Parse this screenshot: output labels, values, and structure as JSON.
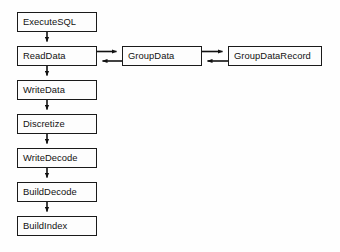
{
  "diagram": {
    "type": "flowchart",
    "background_color": "#fefefe",
    "box_border_color": "#1a1a1a",
    "box_fill_color": "#fdfdfd",
    "arrow_color": "#111111",
    "nodes": [
      {
        "id": "executesql",
        "label": "ExecuteSQL",
        "x": 17,
        "y": 12,
        "w": 80,
        "h": 20
      },
      {
        "id": "readdata",
        "label": "ReadData",
        "x": 17,
        "y": 46,
        "w": 80,
        "h": 20
      },
      {
        "id": "groupdata",
        "label": "GroupData",
        "x": 122,
        "y": 46,
        "w": 80,
        "h": 20
      },
      {
        "id": "groupdatarecord",
        "label": "GroupDataRecord",
        "x": 228,
        "y": 46,
        "w": 94,
        "h": 20
      },
      {
        "id": "writedata",
        "label": "WriteData",
        "x": 17,
        "y": 80,
        "w": 80,
        "h": 20
      },
      {
        "id": "discretize",
        "label": "Discretize",
        "x": 17,
        "y": 114,
        "w": 80,
        "h": 20
      },
      {
        "id": "writedecode",
        "label": "WriteDecode",
        "x": 17,
        "y": 148,
        "w": 80,
        "h": 20
      },
      {
        "id": "builddecode",
        "label": "BuildDecode",
        "x": 17,
        "y": 182,
        "w": 80,
        "h": 20
      },
      {
        "id": "buildindex",
        "label": "BuildIndex",
        "x": 17,
        "y": 216,
        "w": 80,
        "h": 20
      }
    ],
    "edges": [
      {
        "id": "executesql-to-readdata",
        "from": "executesql",
        "to": "readdata",
        "direction": "down"
      },
      {
        "id": "readdata-to-writedata",
        "from": "readdata",
        "to": "writedata",
        "direction": "down"
      },
      {
        "id": "writedata-to-discretize",
        "from": "writedata",
        "to": "discretize",
        "direction": "down"
      },
      {
        "id": "discretize-to-writedecode",
        "from": "discretize",
        "to": "writedecode",
        "direction": "down"
      },
      {
        "id": "writedecode-to-builddecode",
        "from": "writedecode",
        "to": "builddecode",
        "direction": "down"
      },
      {
        "id": "builddecode-to-buildindex",
        "from": "builddecode",
        "to": "buildindex",
        "direction": "down"
      },
      {
        "id": "readdata-to-groupdata",
        "from": "readdata",
        "to": "groupdata",
        "direction": "right"
      },
      {
        "id": "groupdata-to-readdata",
        "from": "groupdata",
        "to": "readdata",
        "direction": "left"
      },
      {
        "id": "groupdata-to-groupdatarecord",
        "from": "groupdata",
        "to": "groupdatarecord",
        "direction": "right"
      },
      {
        "id": "groupdatarecord-to-groupdata",
        "from": "groupdatarecord",
        "to": "groupdata",
        "direction": "left"
      }
    ]
  }
}
